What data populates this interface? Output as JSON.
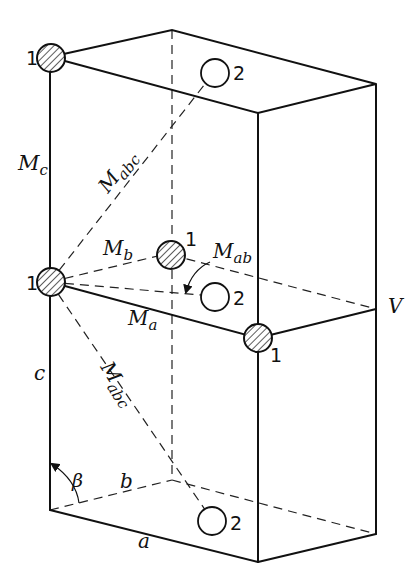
{
  "figure": {
    "type": "unit-cell-diagram"
  },
  "labels": {
    "Mc": {
      "main": "M",
      "sub": "c"
    },
    "Mabc_upper": {
      "main": "M",
      "sub": "abc"
    },
    "Mb": {
      "main": "M",
      "sub": "b"
    },
    "Mab": {
      "main": "M",
      "sub": "ab"
    },
    "Ma": {
      "main": "M",
      "sub": "a"
    },
    "Mabc_lower": {
      "main": "M",
      "sub": "abc"
    },
    "V": "V",
    "c": "c",
    "b": "b",
    "a": "a",
    "beta": "β"
  },
  "atoms": [
    {
      "id": "top-left",
      "type": "1",
      "label": "1",
      "style": "hatched"
    },
    {
      "id": "top-back",
      "type": "2",
      "label": "2",
      "style": "open"
    },
    {
      "id": "mid-left",
      "type": "1",
      "label": "1",
      "style": "hatched"
    },
    {
      "id": "mid-center",
      "type": "1",
      "label": "1",
      "style": "hatched"
    },
    {
      "id": "mid-center-2",
      "type": "2",
      "label": "2",
      "style": "open"
    },
    {
      "id": "mid-front",
      "type": "1",
      "label": "1",
      "style": "hatched"
    },
    {
      "id": "bottom-center",
      "type": "2",
      "label": "2",
      "style": "open"
    }
  ],
  "colors": {
    "ink": "#111111",
    "background": "#ffffff"
  }
}
